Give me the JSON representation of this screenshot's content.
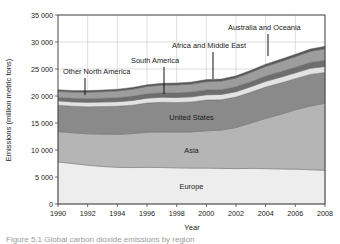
{
  "figure": {
    "caption": "Figure 5.1 Global carbon dioxide emissions by region"
  },
  "chart_data": {
    "type": "area",
    "stacked": true,
    "title": "",
    "xlabel": "Year",
    "ylabel": "Emissions (million metric tons)",
    "xlim": [
      1990,
      2008
    ],
    "ylim": [
      0,
      35000
    ],
    "grid": true,
    "legend_position": "inline-annotations",
    "x": [
      1990,
      1991,
      1992,
      1993,
      1994,
      1995,
      1996,
      1997,
      1998,
      1999,
      2000,
      2001,
      2002,
      2003,
      2004,
      2005,
      2006,
      2007,
      2008
    ],
    "xticks": [
      1990,
      1992,
      1994,
      1996,
      1998,
      2000,
      2002,
      2004,
      2006,
      2008
    ],
    "yticks": [
      0,
      5000,
      10000,
      15000,
      20000,
      25000,
      30000,
      35000
    ],
    "ytick_labels": [
      "0",
      "5 000",
      "10 000",
      "15 000",
      "20 000",
      "25 000",
      "30 000",
      "35 000"
    ],
    "series": [
      {
        "name": "Europe",
        "color": "#ededed",
        "label_position": "inside",
        "values": [
          7800,
          7500,
          7200,
          6950,
          6800,
          6750,
          6800,
          6750,
          6700,
          6650,
          6650,
          6600,
          6550,
          6600,
          6550,
          6500,
          6450,
          6350,
          6250
        ]
      },
      {
        "name": "Asia",
        "color": "#b5b5b5",
        "label_position": "inside",
        "values": [
          5600,
          5700,
          5800,
          6000,
          6100,
          6300,
          6500,
          6600,
          6600,
          6700,
          6900,
          7100,
          7600,
          8400,
          9300,
          10100,
          11000,
          11800,
          12400
        ]
      },
      {
        "name": "United States",
        "color": "#8a8a8a",
        "label_position": "inside",
        "values": [
          4900,
          4900,
          5000,
          5100,
          5200,
          5250,
          5400,
          5500,
          5500,
          5550,
          5700,
          5600,
          5650,
          5700,
          5800,
          5800,
          5750,
          5850,
          5700
        ]
      },
      {
        "name": "Other North America",
        "color": "#e3e3e3",
        "label_position": "callout",
        "callout_year": 1993,
        "values": [
          800,
          810,
          820,
          830,
          850,
          870,
          900,
          920,
          930,
          950,
          980,
          980,
          1000,
          1030,
          1060,
          1080,
          1090,
          1120,
          1120
        ]
      },
      {
        "name": "South America",
        "color": "#6e6e6e",
        "label_position": "callout",
        "callout_year": 1997,
        "values": [
          650,
          670,
          690,
          710,
          740,
          770,
          800,
          840,
          870,
          880,
          900,
          900,
          910,
          930,
          980,
          1010,
          1040,
          1080,
          1120
        ]
      },
      {
        "name": "Africa and Middle East",
        "color": "#9d9d9d",
        "label_position": "callout",
        "callout_year": 2001,
        "values": [
          1100,
          1140,
          1180,
          1210,
          1250,
          1300,
          1350,
          1400,
          1440,
          1470,
          1520,
          1560,
          1620,
          1700,
          1790,
          1870,
          1950,
          2050,
          2150
        ]
      },
      {
        "name": "Australia and Oceania",
        "color": "#585858",
        "label_position": "callout",
        "callout_year": 2005,
        "values": [
          300,
          305,
          310,
          320,
          325,
          335,
          345,
          355,
          365,
          375,
          385,
          390,
          400,
          410,
          420,
          430,
          440,
          450,
          460
        ]
      }
    ],
    "totals": [
      21150,
      21025,
      21000,
      21120,
      21265,
      21575,
      22095,
      22365,
      22405,
      22575,
      23035,
      23130,
      23730,
      24770,
      25900,
      26790,
      27720,
      28700,
      29200
    ]
  }
}
